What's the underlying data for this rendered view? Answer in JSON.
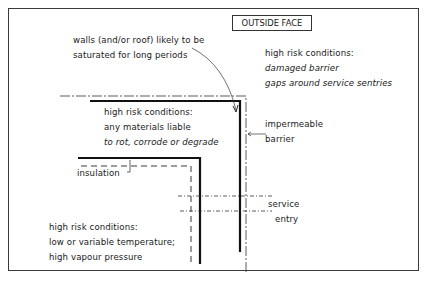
{
  "diagram": {
    "type": "building-envelope-section",
    "outside_face_label": "OUTSIDE FACE",
    "callouts": {
      "saturated": {
        "lines": [
          "walls (and/or roof) likely to be",
          "saturated for long periods"
        ]
      },
      "outside_risk": {
        "lines": [
          "high risk conditions:",
          "damaged barrier",
          "gaps around service sentries"
        ]
      },
      "middle_risk": {
        "lines": [
          "high risk conditions:",
          "any materials liable",
          "to rot, corrode or degrade"
        ]
      },
      "inside_risk": {
        "lines": [
          "high risk conditions:",
          "low or variable temperature;",
          "high vapour pressure"
        ]
      }
    },
    "labels": {
      "impermeable_barrier": [
        "impermeable",
        "barrier"
      ],
      "insulation": "insulation",
      "service_entry": [
        "service",
        "entry"
      ]
    },
    "colors": {
      "line": "#1a1a1a",
      "frame": "#3a3a3a",
      "background": "#ffffff"
    }
  }
}
